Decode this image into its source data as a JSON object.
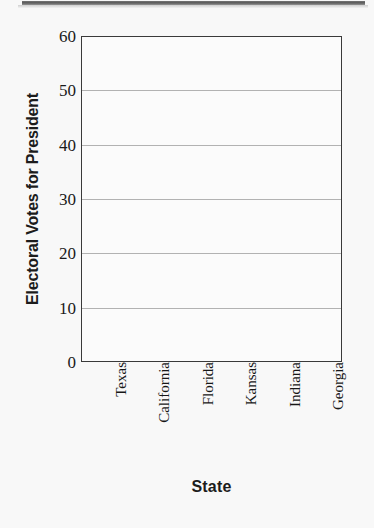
{
  "chart_data": {
    "type": "bar",
    "title": "",
    "xlabel": "State",
    "ylabel": "Electoral Votes for President",
    "categories": [
      "Texas",
      "California",
      "Florida",
      "Kansas",
      "Indiana",
      "Georgia"
    ],
    "values": [
      null,
      null,
      null,
      null,
      null,
      null
    ],
    "series": [
      {
        "name": "Electoral Votes for President",
        "values": [
          null,
          null,
          null,
          null,
          null,
          null
        ]
      }
    ],
    "note": "Blank worksheet grid: axes, gridlines and labels drawn, no bars plotted",
    "ylim": [
      0,
      60
    ],
    "ytick_labels": [
      "60",
      "50",
      "40",
      "30",
      "20",
      "10",
      "0"
    ],
    "ytick_values": [
      60,
      50,
      40,
      30,
      20,
      10,
      0
    ],
    "ytick_step": 10,
    "grid": true,
    "gridline_values": [
      50,
      40,
      30,
      20,
      10
    ],
    "legend": null,
    "axis_color": "#3a3a3a",
    "grid_color": "#9a9a9a",
    "plot_background": "#fbfbfb",
    "page_background": "#f8f8f8",
    "text_color": "#1a1a1a"
  },
  "page": {
    "scan_edge_label": "scanned-page-edge"
  }
}
